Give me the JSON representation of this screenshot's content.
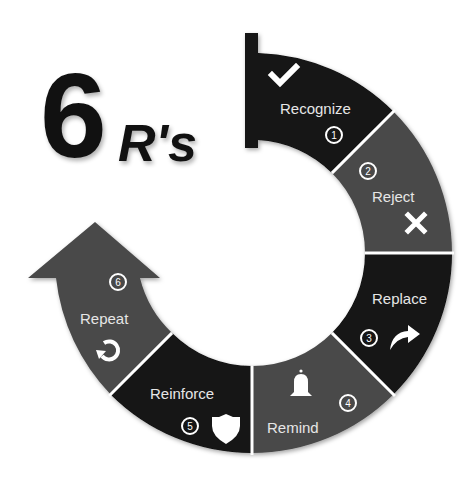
{
  "title": {
    "number": "6",
    "suffix": "R's"
  },
  "colors": {
    "dark": "#121212",
    "gray": "#4a4a4a",
    "divider": "#ffffff",
    "text": "#e6e6e6"
  },
  "steps": [
    {
      "number": "1",
      "label": "Recognize",
      "icon": "checkmark-icon"
    },
    {
      "number": "2",
      "label": "Reject",
      "icon": "x-mark-icon"
    },
    {
      "number": "3",
      "label": "Replace",
      "icon": "forward-arrow-icon"
    },
    {
      "number": "4",
      "label": "Remind",
      "icon": "bell-icon"
    },
    {
      "number": "5",
      "label": "Reinforce",
      "icon": "shield-icon"
    },
    {
      "number": "6",
      "label": "Repeat",
      "icon": "repeat-icon"
    }
  ]
}
